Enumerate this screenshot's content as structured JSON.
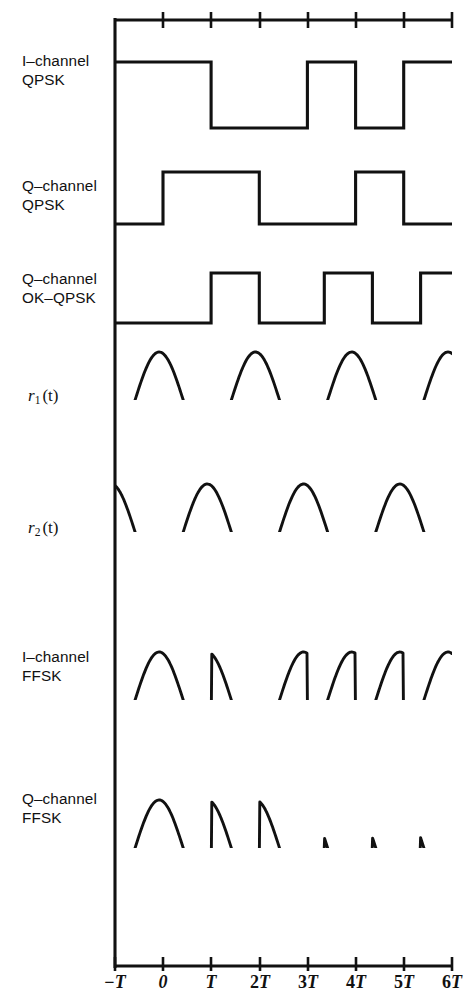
{
  "figure": {
    "type": "waveform-timing-diagram",
    "title": "",
    "axis": {
      "top_axis_present": true,
      "x_tick_labels": [
        "−T",
        "0",
        "T",
        "2T",
        "3T",
        "4T",
        "5T",
        "6T"
      ],
      "x_tick_values": [
        -1,
        0,
        1,
        2,
        3,
        4,
        5,
        6
      ],
      "x_tick_px": [
        115,
        163,
        211,
        260,
        308,
        356,
        404,
        452
      ],
      "x_min": -1,
      "x_max": 6,
      "unit": "T",
      "grid": false
    },
    "rows": [
      {
        "id": "i-channel-qpsk",
        "label_lines": [
          "I–channel",
          "QPSK"
        ],
        "kind": "square",
        "symbol_period": 2,
        "offset": 0,
        "levels": [
          1,
          -1,
          1,
          -1,
          1
        ],
        "transitions_t": [
          1,
          3,
          4,
          5
        ]
      },
      {
        "id": "q-channel-qpsk",
        "label_lines": [
          "Q–channel",
          "QPSK"
        ],
        "kind": "square",
        "symbol_period": 2,
        "offset": 0,
        "levels": [
          -1,
          1,
          -1,
          1,
          -1,
          1
        ],
        "transitions_t": [
          0,
          2,
          4,
          5
        ]
      },
      {
        "id": "q-channel-ok-qpsk",
        "label_lines": [
          "Q–channel",
          "OK–QPSK"
        ],
        "kind": "square",
        "symbol_period": 2,
        "offset": 0.5,
        "levels": [
          -1,
          1,
          -1,
          1,
          -1,
          1
        ],
        "transitions_t": [
          1,
          2,
          3.35,
          4.35,
          5.35
        ]
      },
      {
        "id": "r1-t",
        "label_math": "r₁(t)",
        "label_base": "r",
        "label_sub": "1",
        "label_arg": "(t)",
        "kind": "sine",
        "period": 2,
        "phase_t": -0.58,
        "amplitude": 1
      },
      {
        "id": "r2-t",
        "label_math": "r₂(t)",
        "label_base": "r",
        "label_sub": "2",
        "label_arg": "(t)",
        "kind": "sine",
        "period": 2,
        "phase_t": 0.42,
        "amplitude": 1
      },
      {
        "id": "i-channel-ffsk",
        "label_lines": [
          "I–channel",
          "FFSK"
        ],
        "kind": "modulated-sine",
        "carrier_period": 2,
        "carrier_phase_t": -0.58,
        "data_row": "i-channel-qpsk"
      },
      {
        "id": "q-channel-ffsk",
        "label_lines": [
          "Q–channel",
          "FFSK"
        ],
        "kind": "modulated-sine",
        "carrier_period": 2,
        "carrier_phase_t": 0.42,
        "data_row": "q-channel-ok-qpsk"
      }
    ],
    "colors": {
      "ink": "#111111",
      "background": "#ffffff"
    }
  }
}
